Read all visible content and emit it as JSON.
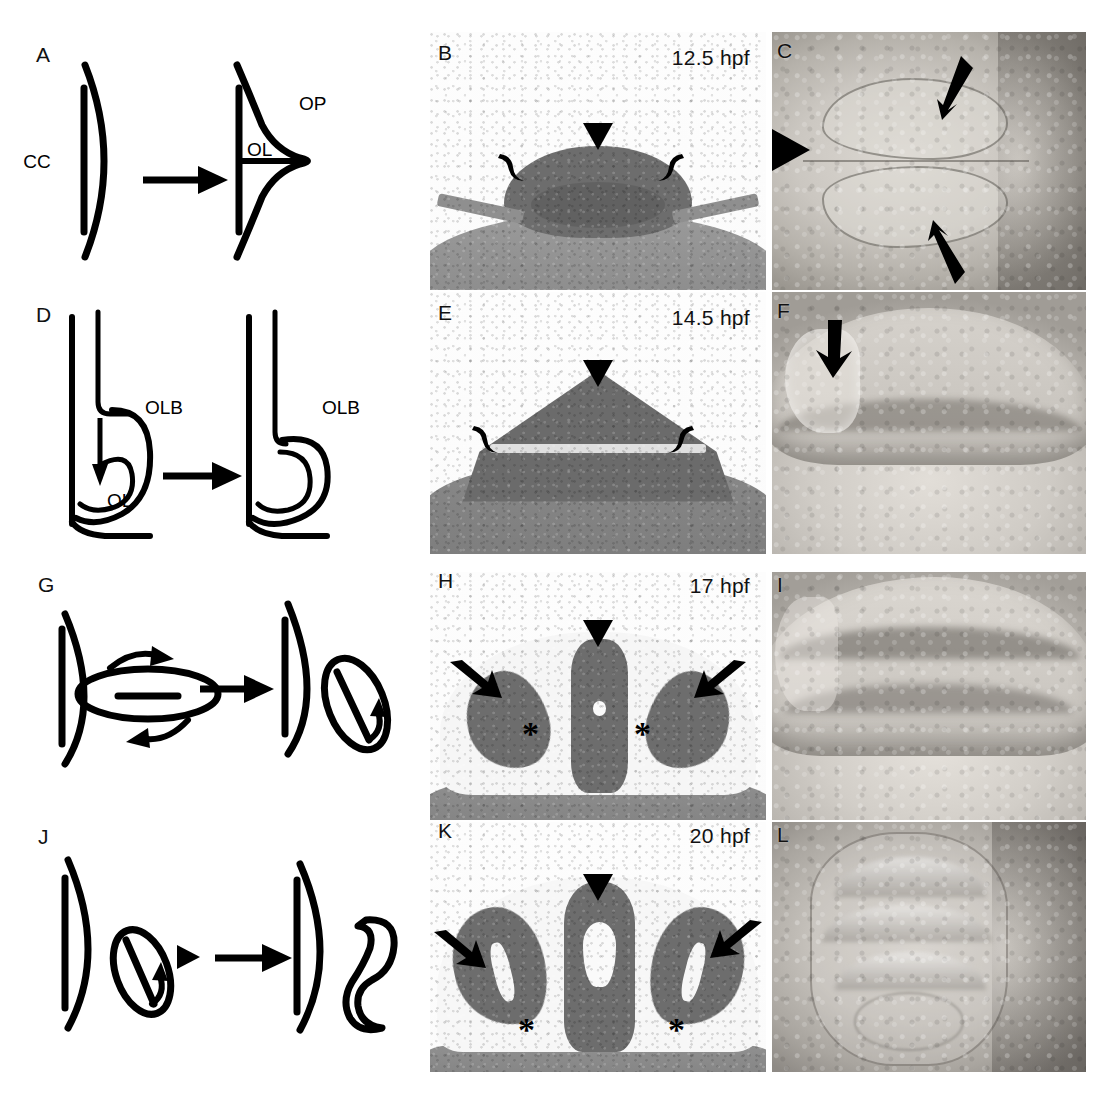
{
  "figure": {
    "type": "multi-panel-scientific-figure",
    "rows": 4,
    "columns": 3,
    "background": "#ffffff"
  },
  "panels": [
    {
      "letter": "A",
      "kind": "schematic",
      "labels": [
        "CC",
        "OL",
        "OP"
      ],
      "time": "",
      "markers": []
    },
    {
      "letter": "B",
      "kind": "histology-section",
      "labels": [],
      "time": "12.5 hpf",
      "markers": [
        "arrowhead",
        "bracket-left",
        "bracket-right"
      ]
    },
    {
      "letter": "C",
      "kind": "live-embryo-dorsal",
      "labels": [],
      "time": "",
      "markers": [
        "arrow-upper",
        "arrow-lower",
        "arrowhead-left"
      ]
    },
    {
      "letter": "D",
      "kind": "schematic",
      "labels": [
        "OLB",
        "OL",
        "OLB"
      ],
      "time": "",
      "markers": []
    },
    {
      "letter": "E",
      "kind": "histology-section",
      "labels": [],
      "time": "14.5 hpf",
      "markers": [
        "arrowhead",
        "bracket-left",
        "bracket-right"
      ]
    },
    {
      "letter": "F",
      "kind": "live-embryo-lateral",
      "labels": [],
      "time": "",
      "markers": [
        "arrow"
      ]
    },
    {
      "letter": "G",
      "kind": "schematic",
      "labels": [],
      "time": "",
      "markers": [
        "rotation-arrows"
      ]
    },
    {
      "letter": "H",
      "kind": "histology-section",
      "labels": [],
      "time": "17 hpf",
      "markers": [
        "arrowhead",
        "arrow-left",
        "arrow-right",
        "asterisk-left",
        "asterisk-right"
      ]
    },
    {
      "letter": "I",
      "kind": "live-embryo-lateral",
      "labels": [],
      "time": "",
      "markers": []
    },
    {
      "letter": "J",
      "kind": "schematic",
      "labels": [],
      "time": "",
      "markers": [
        "arrowhead"
      ]
    },
    {
      "letter": "K",
      "kind": "histology-section",
      "labels": [],
      "time": "20 hpf",
      "markers": [
        "arrowhead",
        "arrow-left",
        "arrow-right",
        "asterisk-left",
        "asterisk-right"
      ]
    },
    {
      "letter": "L",
      "kind": "live-embryo-lateral",
      "labels": [],
      "time": "",
      "markers": []
    }
  ],
  "panel_letters": {
    "a": "A",
    "b": "B",
    "c": "C",
    "d": "D",
    "e": "E",
    "f": "F",
    "g": "G",
    "h": "H",
    "i": "I",
    "j": "J",
    "k": "K",
    "l": "L"
  },
  "time_labels": {
    "b": "12.5 hpf",
    "e": "14.5 hpf",
    "h": "17 hpf",
    "k": "20 hpf"
  },
  "anatomical_labels": {
    "cc": "CC",
    "ol_a": "OL",
    "op": "OP",
    "olb_left": "OLB",
    "ol_d": "OL",
    "olb_right": "OLB"
  },
  "asterisks": {
    "h_left": "*",
    "h_right": "*",
    "k_left": "*",
    "k_right": "*"
  },
  "colors": {
    "ink": "#000000",
    "page": "#ffffff",
    "tissue_dark": "#6d6d6d",
    "yolk": "#9a9a9a",
    "embryo_mid": "#c6c2bc"
  }
}
